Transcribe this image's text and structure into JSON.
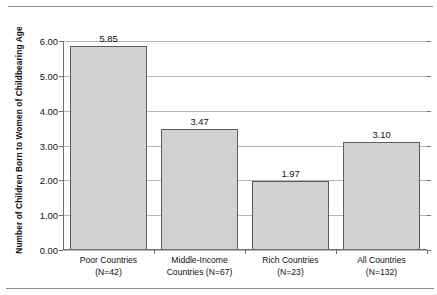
{
  "chart_data": {
    "type": "bar",
    "title": "",
    "xlabel": "",
    "ylabel": "Number of Children Born to Women of Childbearing Age",
    "ylim": [
      0,
      6
    ],
    "ytick_labels": [
      "0.00",
      "1.00",
      "2.00",
      "3.00",
      "4.00",
      "5.00",
      "6.00"
    ],
    "ytick_values": [
      0,
      1,
      2,
      3,
      4,
      5,
      6
    ],
    "grid": true,
    "legend": "none",
    "categories": [
      "Poor Countries (N=42)",
      "Middle-Income Countries (N=67)",
      "Rich Countries (N=23)",
      "All Countries (N=132)"
    ],
    "values": [
      5.85,
      3.47,
      1.97,
      3.1
    ],
    "data_labels": [
      "5.85",
      "3.47",
      "1.97",
      "3.10"
    ],
    "bar_color": "#d2d2d2",
    "bar_edge_color": "#5c5c5c",
    "grid_color": "#b7b7b7",
    "axis_color": "#6e6e6e"
  },
  "axis": {
    "y_title": "Number of Children Born to Women of Childbearing Age",
    "y_ticks": [
      {
        "label": "6.00",
        "value": 6
      },
      {
        "label": "5.00",
        "value": 5
      },
      {
        "label": "4.00",
        "value": 4
      },
      {
        "label": "3.00",
        "value": 3
      },
      {
        "label": "2.00",
        "value": 2
      },
      {
        "label": "1.00",
        "value": 1
      },
      {
        "label": "0.00",
        "value": 0
      }
    ]
  },
  "bars": [
    {
      "value": 5.85,
      "label": "5.85",
      "line1": "Poor Countries",
      "line2": "(N=42)"
    },
    {
      "value": 3.47,
      "label": "3.47",
      "line1": "Middle-Income",
      "line2": "Countries (N=67)"
    },
    {
      "value": 1.97,
      "label": "1.97",
      "line1": "Rich Countries",
      "line2": "(N=23)"
    },
    {
      "value": 3.1,
      "label": "3.10",
      "line1": "All Countries",
      "line2": "(N=132)"
    }
  ]
}
